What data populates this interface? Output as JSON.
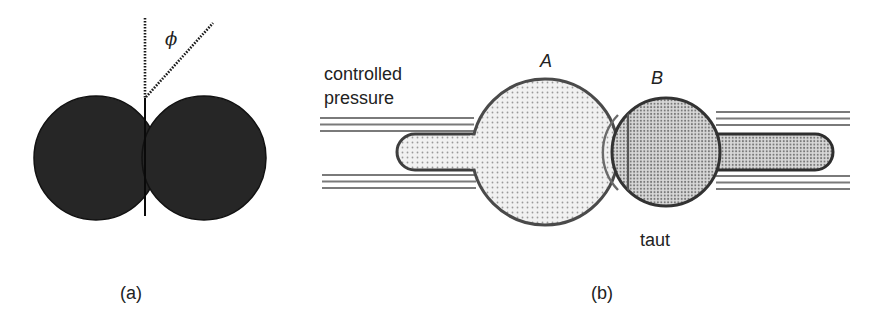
{
  "panel_a": {
    "caption": "(a)",
    "angle_label": "ϕ",
    "colors": {
      "fill": "#262626",
      "stroke": "#111111",
      "dotted": "#1a1a1a"
    }
  },
  "panel_b": {
    "caption": "(b)",
    "left_label_line1": "controlled",
    "left_label_line2": "pressure",
    "vesicle_a_label": "A",
    "vesicle_b_label": "B",
    "bottom_label": "taut",
    "colors": {
      "outline": "#444444",
      "fill_a": "#ececec",
      "fill_b": "#c4c4c4",
      "pipette_lines": "#7a7a7a"
    }
  }
}
